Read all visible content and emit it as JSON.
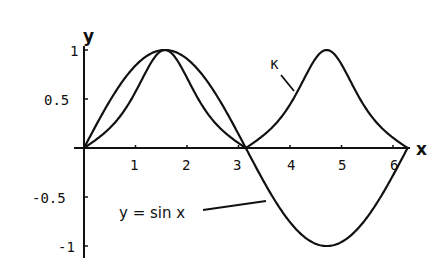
{
  "chart_data": {
    "type": "line",
    "title": "",
    "xlabel": "x",
    "ylabel": "y",
    "xlim": [
      0,
      6.6
    ],
    "ylim": [
      -1.05,
      1.05
    ],
    "x_ticks": [
      "1",
      "2",
      "3",
      "4",
      "5",
      "6"
    ],
    "y_ticks": [
      "1",
      "0.5",
      "-0.5",
      "-1"
    ],
    "grid": false,
    "legend": null,
    "series": [
      {
        "name": "y = sin x",
        "formula": "sin(x)",
        "x": [
          0,
          0.5236,
          1.0472,
          1.5708,
          2.0944,
          2.618,
          3.1416,
          3.6652,
          4.1888,
          4.7124,
          5.236,
          5.7596,
          6.2832
        ],
        "values": [
          0,
          0.5,
          0.866,
          1,
          0.866,
          0.5,
          0,
          -0.5,
          -0.866,
          -1,
          -0.866,
          -0.5,
          0
        ]
      },
      {
        "name": "κ",
        "formula": "|sin x| / (1 + cos^2 x)^(3/2)",
        "x": [
          0,
          0.5236,
          1.0472,
          1.5708,
          2.0944,
          2.618,
          3.1416,
          3.6652,
          4.1888,
          4.7124,
          5.236,
          5.7596,
          6.2832
        ],
        "values": [
          0,
          0.186,
          0.619,
          1,
          0.619,
          0.186,
          0,
          0.186,
          0.619,
          1,
          0.619,
          0.186,
          0
        ]
      }
    ],
    "annotations": [
      {
        "text": "κ",
        "points_to": "curvature curve near x≈4"
      },
      {
        "text": "y = sin x",
        "points_to": "sine curve near x≈3.5"
      }
    ]
  },
  "labels": {
    "x_axis": "x",
    "y_axis": "y",
    "kappa": "κ",
    "sine": "y = sin x",
    "xt1": "1",
    "xt2": "2",
    "xt3": "3",
    "xt4": "4",
    "xt5": "5",
    "xt6": "6",
    "yt1": "1",
    "yt05": "0.5",
    "ytm05": "-0.5",
    "ytm1": "-1"
  }
}
